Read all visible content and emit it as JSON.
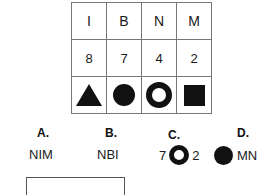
{
  "puzzle": {
    "grid": {
      "letters": [
        "I",
        "B",
        "N",
        "M"
      ],
      "numbers": [
        "8",
        "7",
        "4",
        "2"
      ],
      "shapes": [
        "triangle",
        "filled-circle",
        "ring",
        "filled-square"
      ]
    }
  },
  "options": [
    {
      "key": "A.",
      "text": "NIM"
    },
    {
      "key": "B.",
      "text": "NBI"
    },
    {
      "key": "C.",
      "left_number": "7",
      "shape": "ring",
      "right_number": "2"
    },
    {
      "key": "D.",
      "shape": "filled-circle",
      "text": "MN"
    }
  ],
  "answer_input": {
    "value": "",
    "placeholder": ""
  },
  "colors": {
    "ink": "#111111",
    "grid_line": "#777777",
    "box_border": "#555555",
    "background": "#ffffff"
  }
}
